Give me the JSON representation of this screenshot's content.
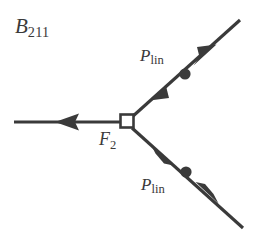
{
  "figure": {
    "title_label": {
      "base": "B",
      "sub": "211",
      "full": "B211"
    },
    "node_label": {
      "base": "F",
      "sub": "2",
      "full": "F2"
    },
    "force_label_upper": {
      "base": "P",
      "sub": "lin",
      "full": "Plin"
    },
    "force_label_lower": {
      "base": "P",
      "sub": "lin",
      "full": "Plin"
    },
    "colors": {
      "stroke": "#3a3a3a",
      "background": "#ffffff",
      "node_fill": "#ffffff",
      "dot_fill": "#3a3a3a"
    },
    "geometry": {
      "joint_square": {
        "x": 120,
        "y": 114,
        "size": 13
      },
      "horizontal_member": {
        "x1": 14,
        "y1": 122,
        "x2": 120,
        "y2": 122
      },
      "upper_member": {
        "x1": 133,
        "y1": 116,
        "x2": 240,
        "y2": 20
      },
      "lower_member": {
        "x1": 133,
        "y1": 127,
        "x2": 243,
        "y2": 228
      },
      "upper_dot": {
        "cx": 185,
        "cy": 74,
        "r": 5.5
      },
      "lower_dot": {
        "cx": 186,
        "cy": 172,
        "r": 5.5
      },
      "left_arrow_tip": {
        "x": 55,
        "y": 122
      },
      "upper_outward_arrow_tip": {
        "x": 216,
        "y": 45
      },
      "upper_inward_arrow_tip": {
        "x": 150,
        "y": 100
      },
      "lower_inward_arrow_tip": {
        "x": 151,
        "y": 145
      },
      "lower_outward_arrow_tip": {
        "x": 219,
        "y": 204
      }
    }
  }
}
